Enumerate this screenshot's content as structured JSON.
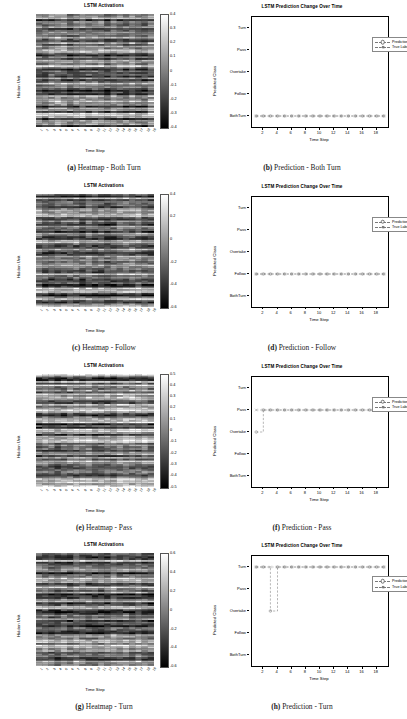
{
  "figure": {
    "n_rows": 4,
    "classes": [
      "BothTurn",
      "Follow",
      "Overtake",
      "Pass",
      "Turn"
    ],
    "heatmap": {
      "title": "LSTM Activations",
      "xlabel": "Time Step",
      "ylabel": "Hidden Unit",
      "xticks": [
        "1",
        "2",
        "3",
        "4",
        "5",
        "6",
        "7",
        "8",
        "9",
        "10",
        "11",
        "12",
        "13",
        "14",
        "15",
        "16",
        "17",
        "18",
        "19"
      ]
    },
    "prediction": {
      "title": "LSTM Prediction Change Over Time",
      "xlabel": "Time Step",
      "ylabel": "Predicted Class",
      "xticks": [
        "2",
        "4",
        "6",
        "8",
        "10",
        "12",
        "14",
        "16",
        "18"
      ],
      "xlim": [
        1,
        19
      ],
      "legend": [
        "Prediction",
        "True Label"
      ]
    }
  },
  "panels": [
    {
      "id": "a",
      "caption_letter": "(a)",
      "caption_text": "Heatmap - Both Turn",
      "kind": "heatmap",
      "chart_data": {
        "type": "heatmap",
        "title": "LSTM Activations",
        "xlabel": "Time Step",
        "ylabel": "Hidden Unit",
        "cbar_ticks": [
          "0.4",
          "0.3",
          "0.2",
          "0.1",
          "0",
          "-0.1",
          "-0.2",
          "-0.3",
          "-0.4"
        ],
        "vmin": -0.45,
        "vmax": 0.45,
        "n_timesteps": 19,
        "n_hidden": 64,
        "colormap": "gray",
        "seed": 11
      }
    },
    {
      "id": "b",
      "caption_letter": "(b)",
      "caption_text": "Prediction - Both Turn",
      "kind": "prediction",
      "chart_data": {
        "type": "line",
        "title": "LSTM Prediction Change Over Time",
        "xlabel": "Time Step",
        "ylabel": "Predicted Class",
        "categories": [
          "BothTurn",
          "Follow",
          "Overtake",
          "Pass",
          "Turn"
        ],
        "x": [
          1,
          2,
          3,
          4,
          5,
          6,
          7,
          8,
          9,
          10,
          11,
          12,
          13,
          14,
          15,
          16,
          17,
          18,
          19
        ],
        "series": [
          {
            "name": "Prediction",
            "values": [
              "BothTurn",
              "BothTurn",
              "BothTurn",
              "BothTurn",
              "BothTurn",
              "BothTurn",
              "BothTurn",
              "BothTurn",
              "BothTurn",
              "BothTurn",
              "BothTurn",
              "BothTurn",
              "BothTurn",
              "BothTurn",
              "BothTurn",
              "BothTurn",
              "BothTurn",
              "BothTurn",
              "BothTurn"
            ]
          },
          {
            "name": "True Label",
            "values": [
              "BothTurn",
              "BothTurn",
              "BothTurn",
              "BothTurn",
              "BothTurn",
              "BothTurn",
              "BothTurn",
              "BothTurn",
              "BothTurn",
              "BothTurn",
              "BothTurn",
              "BothTurn",
              "BothTurn",
              "BothTurn",
              "BothTurn",
              "BothTurn",
              "BothTurn",
              "BothTurn",
              "BothTurn"
            ]
          }
        ],
        "legend_position": "upper right",
        "grid": false
      }
    },
    {
      "id": "c",
      "caption_letter": "(c)",
      "caption_text": "Heatmap - Follow",
      "kind": "heatmap",
      "chart_data": {
        "type": "heatmap",
        "title": "LSTM Activations",
        "xlabel": "Time Step",
        "ylabel": "Hidden Unit",
        "cbar_ticks": [
          "0.4",
          "0.2",
          "0",
          "-0.2",
          "-0.4",
          "-0.6"
        ],
        "vmin": -0.7,
        "vmax": 0.5,
        "n_timesteps": 19,
        "n_hidden": 64,
        "colormap": "gray",
        "seed": 27
      }
    },
    {
      "id": "d",
      "caption_letter": "(d)",
      "caption_text": "Prediction - Follow",
      "kind": "prediction",
      "chart_data": {
        "type": "line",
        "title": "LSTM Prediction Change Over Time",
        "xlabel": "Time Step",
        "ylabel": "Predicted Class",
        "categories": [
          "BothTurn",
          "Follow",
          "Overtake",
          "Pass",
          "Turn"
        ],
        "x": [
          1,
          2,
          3,
          4,
          5,
          6,
          7,
          8,
          9,
          10,
          11,
          12,
          13,
          14,
          15,
          16,
          17,
          18,
          19
        ],
        "series": [
          {
            "name": "Prediction",
            "values": [
              "Follow",
              "Follow",
              "Follow",
              "Follow",
              "Follow",
              "Follow",
              "Follow",
              "Follow",
              "Follow",
              "Follow",
              "Follow",
              "Follow",
              "Follow",
              "Follow",
              "Follow",
              "Follow",
              "Follow",
              "Follow",
              "Follow"
            ]
          },
          {
            "name": "True Label",
            "values": [
              "Follow",
              "Follow",
              "Follow",
              "Follow",
              "Follow",
              "Follow",
              "Follow",
              "Follow",
              "Follow",
              "Follow",
              "Follow",
              "Follow",
              "Follow",
              "Follow",
              "Follow",
              "Follow",
              "Follow",
              "Follow",
              "Follow"
            ]
          }
        ],
        "legend_position": "upper right",
        "grid": false
      }
    },
    {
      "id": "e",
      "caption_letter": "(e)",
      "caption_text": "Heatmap - Pass",
      "kind": "heatmap",
      "chart_data": {
        "type": "heatmap",
        "title": "LSTM Activations",
        "xlabel": "Time Step",
        "ylabel": "Hidden Unit",
        "cbar_ticks": [
          "0.5",
          "0.4",
          "0.3",
          "0.2",
          "0.1",
          "0",
          "-0.1",
          "-0.2",
          "-0.3",
          "-0.4",
          "-0.5"
        ],
        "vmin": -0.55,
        "vmax": 0.55,
        "n_timesteps": 19,
        "n_hidden": 64,
        "colormap": "gray",
        "seed": 43
      }
    },
    {
      "id": "f",
      "caption_letter": "(f)",
      "caption_text": "Prediction - Pass",
      "kind": "prediction",
      "chart_data": {
        "type": "line",
        "title": "LSTM Prediction Change Over Time",
        "xlabel": "Time Step",
        "ylabel": "Predicted Class",
        "categories": [
          "BothTurn",
          "Follow",
          "Overtake",
          "Pass",
          "Turn"
        ],
        "x": [
          1,
          2,
          3,
          4,
          5,
          6,
          7,
          8,
          9,
          10,
          11,
          12,
          13,
          14,
          15,
          16,
          17,
          18,
          19
        ],
        "series": [
          {
            "name": "Prediction",
            "values": [
              "Overtake",
              "Pass",
              "Pass",
              "Pass",
              "Pass",
              "Pass",
              "Pass",
              "Pass",
              "Pass",
              "Pass",
              "Pass",
              "Pass",
              "Pass",
              "Pass",
              "Pass",
              "Pass",
              "Pass",
              "Pass",
              "Pass"
            ]
          },
          {
            "name": "True Label",
            "values": [
              "Pass",
              "Pass",
              "Pass",
              "Pass",
              "Pass",
              "Pass",
              "Pass",
              "Pass",
              "Pass",
              "Pass",
              "Pass",
              "Pass",
              "Pass",
              "Pass",
              "Pass",
              "Pass",
              "Pass",
              "Pass",
              "Pass"
            ]
          }
        ],
        "legend_position": "upper right",
        "grid": false
      }
    },
    {
      "id": "g",
      "caption_letter": "(g)",
      "caption_text": "Heatmap - Turn",
      "kind": "heatmap",
      "chart_data": {
        "type": "heatmap",
        "title": "LSTM Activations",
        "xlabel": "Time Step",
        "ylabel": "Hidden Unit",
        "cbar_ticks": [
          "0.6",
          "0.4",
          "0.2",
          "0",
          "-0.2",
          "-0.4",
          "-0.6"
        ],
        "vmin": -0.7,
        "vmax": 0.7,
        "n_timesteps": 19,
        "n_hidden": 64,
        "colormap": "gray",
        "seed": 59
      }
    },
    {
      "id": "h",
      "caption_letter": "(h)",
      "caption_text": "Prediction - Turn",
      "kind": "prediction",
      "chart_data": {
        "type": "line",
        "title": "LSTM Prediction Change Over Time",
        "xlabel": "Time Step",
        "ylabel": "Predicted Class",
        "categories": [
          "BothTurn",
          "Follow",
          "Overtake",
          "Pass",
          "Turn"
        ],
        "x": [
          1,
          2,
          3,
          4,
          5,
          6,
          7,
          8,
          9,
          10,
          11,
          12,
          13,
          14,
          15,
          16,
          17,
          18,
          19
        ],
        "series": [
          {
            "name": "Prediction",
            "values": [
              "Turn",
              "Turn",
              "Overtake",
              "Turn",
              "Turn",
              "Turn",
              "Turn",
              "Turn",
              "Turn",
              "Turn",
              "Turn",
              "Turn",
              "Turn",
              "Turn",
              "Turn",
              "Turn",
              "Turn",
              "Turn",
              "Turn"
            ]
          },
          {
            "name": "True Label",
            "values": [
              "Turn",
              "Turn",
              "Turn",
              "Turn",
              "Turn",
              "Turn",
              "Turn",
              "Turn",
              "Turn",
              "Turn",
              "Turn",
              "Turn",
              "Turn",
              "Turn",
              "Turn",
              "Turn",
              "Turn",
              "Turn",
              "Turn"
            ]
          }
        ],
        "legend_position": "upper right",
        "grid": false
      }
    }
  ]
}
